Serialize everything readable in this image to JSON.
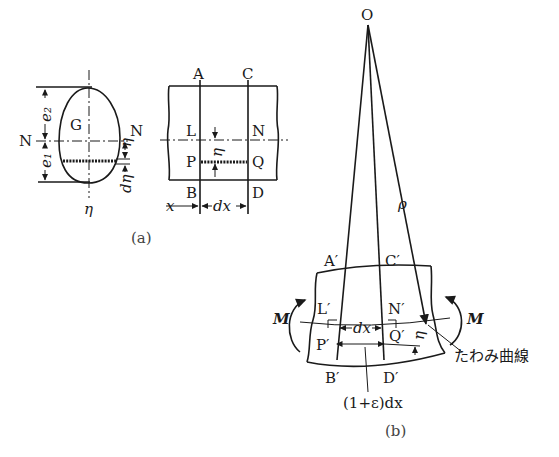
{
  "figure_a": {
    "caption": "(a)",
    "cross_section": {
      "centroid_label": "G",
      "neutral_axis_left": "N",
      "neutral_axis_right": "N",
      "dim_top": "e₂",
      "dim_bottom": "e₁",
      "eta_label": "η",
      "d_eta_label": "dη",
      "axis_label": "η"
    },
    "beam_segment": {
      "top_left": "A",
      "top_right": "C",
      "mid_left": "L",
      "mid_right": "N",
      "fiber_left": "P",
      "fiber_right": "Q",
      "bottom_left": "B",
      "bottom_right": "D",
      "eta_label": "η",
      "x_label": "x",
      "dx_label": "dx"
    }
  },
  "figure_b": {
    "caption": "(b)",
    "center_label": "O",
    "radius_label": "ρ",
    "top_left": "A′",
    "top_right": "C′",
    "mid_left": "L′",
    "mid_right": "N′",
    "fiber_left": "P′",
    "fiber_right": "Q′",
    "bottom_left": "B′",
    "bottom_right": "D′",
    "moment_left": "M",
    "moment_right": "M",
    "dx_label": "dx",
    "eta_label": "η",
    "elongated_label": "(1+ε)dx",
    "deflection_curve_label": "たわみ曲線"
  }
}
